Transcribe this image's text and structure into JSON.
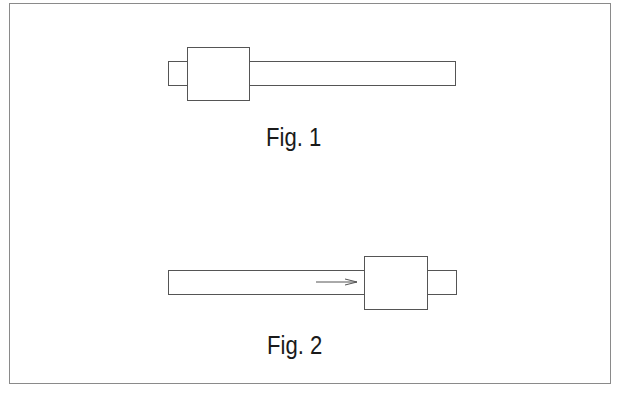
{
  "figures": [
    {
      "caption": "Fig. 1",
      "rod": {
        "x": 168,
        "y": 61,
        "w": 288,
        "h": 25
      },
      "block": {
        "x": 187,
        "y": 47,
        "w": 63,
        "h": 54
      },
      "arrow": null
    },
    {
      "caption": "Fig. 2",
      "rod": {
        "x": 168,
        "y": 270,
        "w": 289,
        "h": 25
      },
      "block": {
        "x": 364,
        "y": 256,
        "w": 64,
        "h": 54
      },
      "arrow": {
        "x1": 316,
        "y": 282,
        "x2": 358,
        "direction": "right"
      }
    }
  ],
  "colors": {
    "stroke": "#555555",
    "frame": "#8a8a8a",
    "text": "#1a1a1a"
  }
}
